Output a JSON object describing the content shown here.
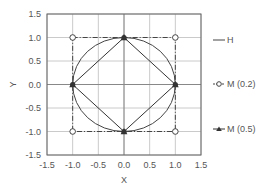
{
  "chart_data": {
    "type": "line",
    "title": "",
    "xlabel": "X",
    "ylabel": "Y",
    "xlim": [
      -1.5,
      1.5
    ],
    "ylim": [
      -1.5,
      1.5
    ],
    "xticks": [
      -1.5,
      -1.0,
      -0.5,
      0.0,
      0.5,
      1.0,
      1.5
    ],
    "yticks": [
      -1.5,
      -1.0,
      -0.5,
      0.0,
      0.5,
      1.0,
      1.5
    ],
    "xtick_labels": [
      "-1.5",
      "-1.0",
      "-0.5",
      "0.0",
      "0.5",
      "1.0",
      "1.5"
    ],
    "ytick_labels": [
      "-1.5",
      "-1.0",
      "-0.5",
      "0.0",
      "0.5",
      "1.0",
      "1.5"
    ],
    "grid": true,
    "legend_position": "right",
    "series": [
      {
        "name": "H",
        "style": "solid",
        "marker": "none",
        "shape": "circle",
        "radius": 1.0,
        "color": "#444444"
      },
      {
        "name": "M (0.2)",
        "style": "dash-dot",
        "marker": "open-circle",
        "color": "#444444",
        "points": [
          [
            -1,
            1
          ],
          [
            1,
            1
          ],
          [
            1,
            -1
          ],
          [
            -1,
            -1
          ],
          [
            -1,
            1
          ]
        ]
      },
      {
        "name": "M (0.5)",
        "style": "solid",
        "marker": "filled-triangle",
        "color": "#333333",
        "points": [
          [
            0,
            1
          ],
          [
            1,
            0
          ],
          [
            0,
            -1
          ],
          [
            -1,
            0
          ],
          [
            0,
            1
          ]
        ]
      }
    ]
  }
}
